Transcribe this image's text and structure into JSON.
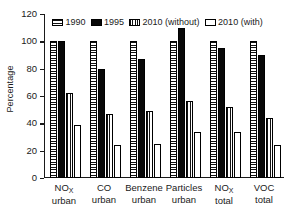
{
  "chart_data": {
    "type": "bar",
    "title": "",
    "xlabel": "",
    "ylabel": "Percentage",
    "ylim": [
      0,
      120
    ],
    "yticks": [
      0,
      20,
      40,
      60,
      80,
      100,
      120
    ],
    "grid": false,
    "legend_position": "top-inside",
    "categories": [
      "NOₓ urban",
      "CO urban",
      "Benzene urban",
      "Particles urban",
      "NOₓ total",
      "VOC total"
    ],
    "category_lines": [
      {
        "line1": "NO",
        "sub": "X",
        "line2": "urban"
      },
      {
        "line1": "CO",
        "sub": "",
        "line2": "urban"
      },
      {
        "line1": "Benzene",
        "sub": "",
        "line2": "urban"
      },
      {
        "line1": "Particles",
        "sub": "",
        "line2": "urban"
      },
      {
        "line1": "NO",
        "sub": "X",
        "line2": "total"
      },
      {
        "line1": "VOC",
        "sub": "",
        "line2": "total"
      }
    ],
    "series": [
      {
        "name": "1990",
        "fill": "horizontal-stripes",
        "values": [
          100,
          100,
          100,
          100,
          100,
          100
        ]
      },
      {
        "name": "1995",
        "fill": "solid-black",
        "values": [
          100,
          80,
          87,
          110,
          95,
          90
        ]
      },
      {
        "name": "2010 (without)",
        "fill": "vertical-stripes",
        "values": [
          62,
          47,
          49,
          56,
          52,
          44
        ]
      },
      {
        "name": "2010 (with)",
        "fill": "white",
        "values": [
          39,
          24,
          25,
          34,
          34,
          24
        ]
      }
    ]
  },
  "axes": {
    "y_title": "Percentage",
    "y_tick_labels": [
      "120",
      "100",
      "80",
      "60",
      "40",
      "20",
      "0"
    ]
  },
  "legend": {
    "entries": [
      {
        "label": "1990",
        "fill": "horizontal-stripes"
      },
      {
        "label": "1995",
        "fill": "solid-black"
      },
      {
        "label": "2010 (without)",
        "fill": "vertical-stripes"
      },
      {
        "label": "2010 (with)",
        "fill": "white"
      }
    ]
  }
}
